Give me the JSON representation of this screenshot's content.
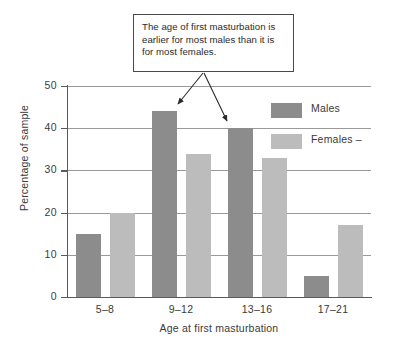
{
  "figure": {
    "annotation": {
      "text": "The age of first masturbation is earlier for most males than it is for most females."
    }
  },
  "chart_data": {
    "type": "bar",
    "title": "",
    "xlabel": "Age at first masturbation",
    "ylabel": "Percentage of sample",
    "categories": [
      "5–8",
      "9–12",
      "13–16",
      "17–21"
    ],
    "series": [
      {
        "name": "Males",
        "values": [
          15,
          44,
          40,
          5
        ],
        "color": "#8c8c8c"
      },
      {
        "name": "Females –",
        "values": [
          20,
          34,
          33,
          17
        ],
        "color": "#bcbcbc"
      }
    ],
    "ylim": [
      0,
      50
    ],
    "yticks": [
      0,
      10,
      20,
      30,
      40,
      50
    ],
    "ytick_labels": [
      "0",
      "10",
      "20",
      "30",
      "40",
      "50"
    ],
    "grid": true,
    "legend_position": "top-right"
  }
}
